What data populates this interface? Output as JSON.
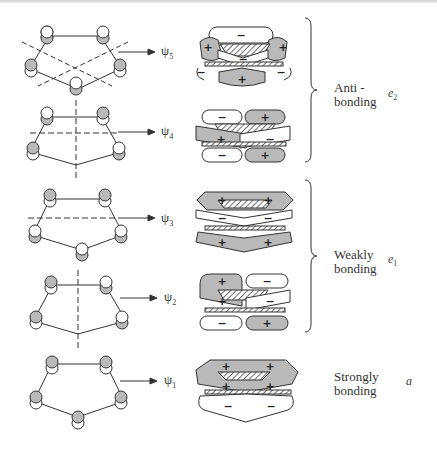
{
  "figure": {
    "colors": {
      "shaded_lobe": "#b9b9b9",
      "line": "#333333",
      "background": "#ffffff"
    },
    "orbitals": [
      {
        "id": "psi5",
        "psi_symbol": "ψ",
        "psi_index": "5",
        "y": 52,
        "nodes": 2,
        "lobe_signs": [
          "+",
          "−",
          "+",
          "−",
          "−",
          "+"
        ]
      },
      {
        "id": "psi4",
        "psi_symbol": "ψ",
        "psi_index": "4",
        "y": 132,
        "nodes": 2,
        "lobe_signs": [
          "−",
          "+",
          "+",
          "−",
          "−",
          "+"
        ]
      },
      {
        "id": "psi3",
        "psi_symbol": "ψ",
        "psi_index": "3",
        "y": 219,
        "nodes": 1,
        "lobe_signs": [
          "+",
          "+",
          "−",
          "−",
          "+",
          "+"
        ]
      },
      {
        "id": "psi2",
        "psi_symbol": "ψ",
        "psi_index": "2",
        "y": 298,
        "nodes": 1,
        "lobe_signs": [
          "+",
          "−",
          "+",
          "−",
          "−",
          "+"
        ]
      },
      {
        "id": "psi1",
        "psi_symbol": "ψ",
        "psi_index": "1",
        "y": 381,
        "nodes": 0,
        "lobe_signs": [
          "+",
          "+",
          "+",
          "+",
          "−",
          "−"
        ]
      }
    ],
    "groups": [
      {
        "id": "antibonding",
        "label_line1": "Anti -",
        "label_line2": "bonding",
        "symmetry": "e",
        "symmetry_sub": "2"
      },
      {
        "id": "weakly",
        "label_line1": "Weakly",
        "label_line2": "bonding",
        "symmetry": "e",
        "symmetry_sub": "1"
      },
      {
        "id": "strongly",
        "label_line1": "Strongly",
        "label_line2": "bonding",
        "symmetry": "a",
        "symmetry_sub": ""
      }
    ]
  }
}
